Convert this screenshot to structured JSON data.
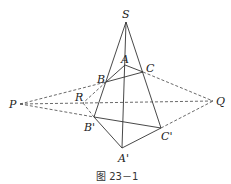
{
  "figure": {
    "caption": "图 23－1",
    "labels": {
      "S": "S",
      "A": "A",
      "B": "B",
      "C": "C",
      "A_prime": "A'",
      "B_prime": "B'",
      "C_prime": "C'",
      "P": "P",
      "Q": "Q",
      "R": "R"
    },
    "points": {
      "S": [
        126,
        22
      ],
      "A": [
        125,
        65
      ],
      "B": [
        106,
        82
      ],
      "C": [
        143,
        72
      ],
      "A_prime": [
        122,
        148
      ],
      "B_prime": [
        94,
        117
      ],
      "C_prime": [
        161,
        128
      ],
      "P": [
        20,
        104
      ],
      "Q": [
        213,
        101
      ],
      "R": [
        83,
        103
      ]
    }
  }
}
